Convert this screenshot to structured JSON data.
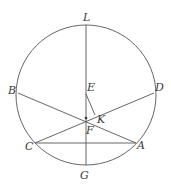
{
  "diagram": {
    "type": "geometry-circle-chords",
    "stroke_color": "#555555",
    "label_color": "#3a3a3a",
    "circle": {
      "cx": 86,
      "cy": 95,
      "r": 70
    },
    "points": {
      "L": {
        "x": 86,
        "y": 25,
        "label": "L"
      },
      "G": {
        "x": 86,
        "y": 165,
        "label": "G"
      },
      "B": {
        "x": 18,
        "y": 93,
        "label": "B"
      },
      "D": {
        "x": 154,
        "y": 93,
        "label": "D"
      },
      "C": {
        "x": 35,
        "y": 143,
        "label": "C"
      },
      "A": {
        "x": 136,
        "y": 143,
        "label": "A"
      },
      "E": {
        "x": 86,
        "y": 94,
        "label": "E"
      },
      "F": {
        "x": 86,
        "y": 118,
        "label": "F"
      },
      "K": {
        "x": 95,
        "y": 115,
        "label": "K"
      }
    },
    "segments": [
      [
        "L",
        "G"
      ],
      [
        "B",
        "A"
      ],
      [
        "D",
        "C"
      ],
      [
        "C",
        "A"
      ],
      [
        "E",
        "K"
      ]
    ]
  }
}
